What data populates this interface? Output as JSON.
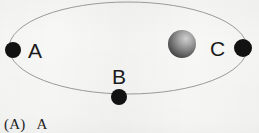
{
  "figure": {
    "background_color": "#f7f7f6",
    "orbit": {
      "name": "elliptical-orbit-path",
      "stroke_color": "#9a9a9a",
      "stroke_width": 1,
      "center_x": 128,
      "center_y": 48,
      "radius_x": 119,
      "radius_y": 46
    },
    "central_body": {
      "label": "",
      "name": "shaded-sphere",
      "center_x": 182,
      "center_y": 44,
      "radius": 14,
      "light_color": "#c9c9c9",
      "dark_color": "#4c4c4c"
    },
    "bodies": [
      {
        "id": "A",
        "label": "A",
        "dot_center_x": 13,
        "dot_center_y": 50,
        "dot_radius": 8,
        "color": "#121212",
        "label_x": 28,
        "label_y": 40
      },
      {
        "id": "B",
        "label": "B",
        "dot_center_x": 119,
        "dot_center_y": 97,
        "dot_radius": 8,
        "color": "#121212",
        "label_x": 112,
        "label_y": 66
      },
      {
        "id": "C",
        "label": "C",
        "dot_center_x": 243,
        "dot_center_y": 48,
        "dot_radius": 9,
        "color": "#121212",
        "label_x": 210,
        "label_y": 38
      }
    ],
    "caption": "(A)   A"
  }
}
